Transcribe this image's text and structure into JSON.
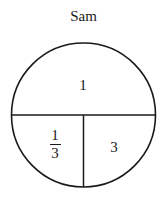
{
  "title": "Sam",
  "circle": {
    "cx": 83.5,
    "cy": 115,
    "r": 72,
    "stroke": "#1a1a1a"
  },
  "sections": {
    "top": {
      "label": "1"
    },
    "bottom_left": {
      "numerator": "1",
      "denominator": "3"
    },
    "bottom_right": {
      "label": "3"
    }
  }
}
